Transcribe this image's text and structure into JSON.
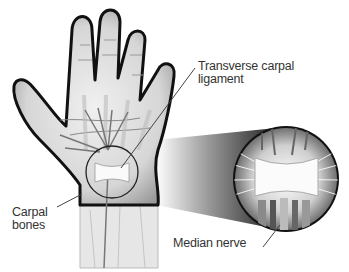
{
  "diagram": {
    "labels": {
      "ligament": {
        "line1": "Transverse carpal",
        "line2": "ligament"
      },
      "bones": {
        "line1": "Carpal",
        "line2": "bones"
      },
      "nerve": "Median nerve"
    },
    "colors": {
      "outline": "#111111",
      "skin": "#d9d9d9",
      "skin_light": "#eeeeee",
      "bone": "#f4f4f4",
      "ligament": "#fafafa",
      "nerve": "#777777",
      "text": "#333333",
      "pointer": "#444444"
    }
  }
}
